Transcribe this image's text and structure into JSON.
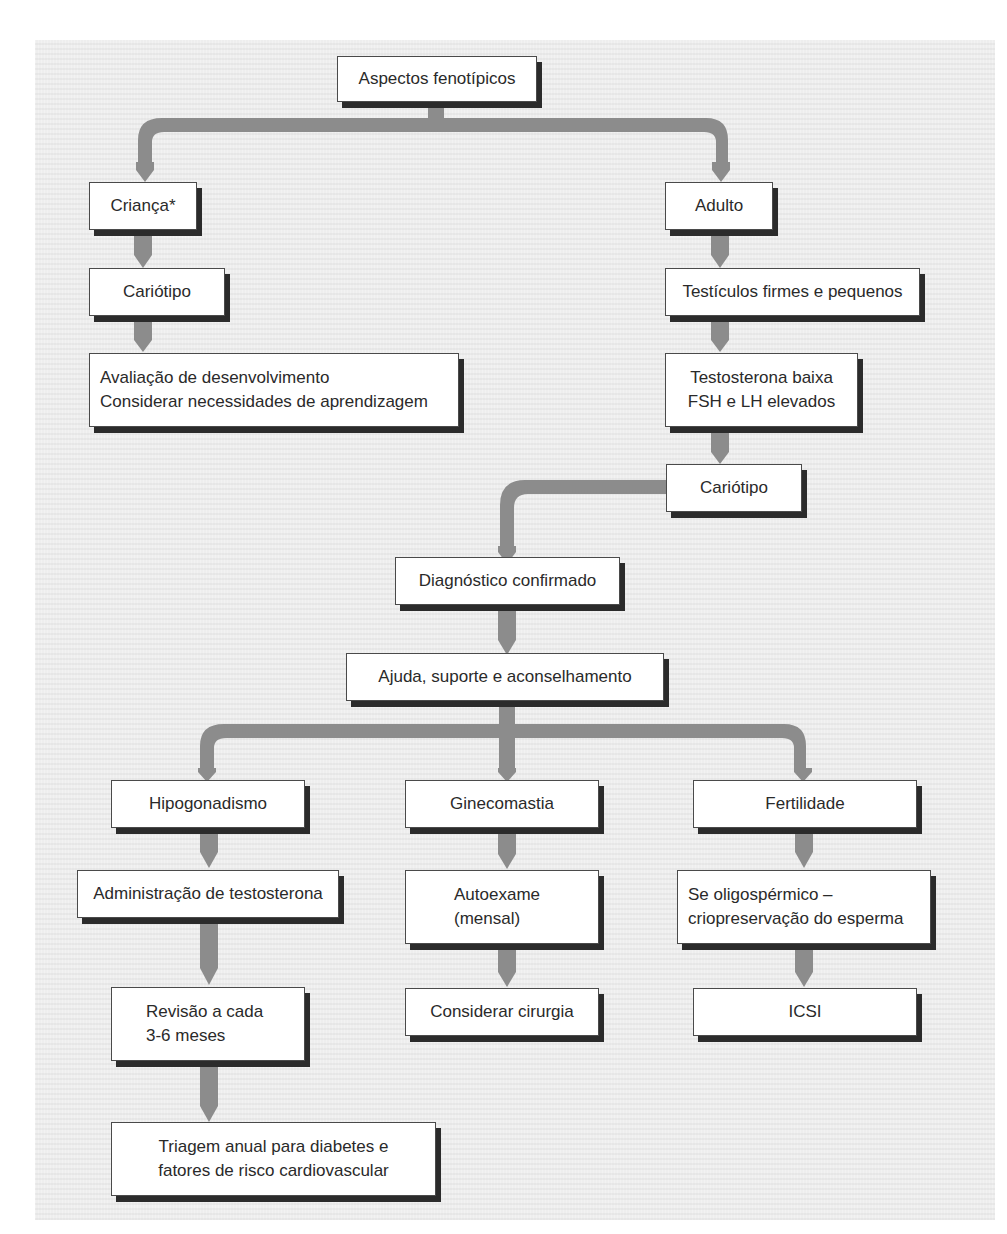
{
  "diagram": {
    "type": "flowchart",
    "colors": {
      "connector": "#8c8c8c",
      "box_border": "#4a4a4a",
      "box_shadow": "#2b2b2b",
      "background": "#eeeeee"
    },
    "nodes": {
      "root": {
        "lines": [
          "Aspectos fenotípicos"
        ]
      },
      "child": {
        "lines": [
          "Criança*"
        ]
      },
      "child_karyotype": {
        "lines": [
          "Cariótipo"
        ]
      },
      "child_eval": {
        "lines": [
          "Avaliação de desenvolvimento",
          "Considerar necessidades de aprendizagem"
        ]
      },
      "adult": {
        "lines": [
          "Adulto"
        ]
      },
      "adult_testes": {
        "lines": [
          "Testículos firmes e pequenos"
        ]
      },
      "adult_hormones": {
        "lines": [
          "Testosterona baixa",
          "FSH e LH elevados"
        ]
      },
      "adult_karyotype": {
        "lines": [
          "Cariótipo"
        ]
      },
      "diagnosis": {
        "lines": [
          "Diagnóstico confirmado"
        ]
      },
      "support": {
        "lines": [
          "Ajuda, suporte e aconselhamento"
        ]
      },
      "hypogonadism": {
        "lines": [
          "Hipogonadismo"
        ]
      },
      "testosterone": {
        "lines": [
          "Administração de testosterona"
        ]
      },
      "review": {
        "lines": [
          "Revisão a cada",
          "3-6 meses"
        ]
      },
      "screening": {
        "lines": [
          "Triagem anual para diabetes e",
          "fatores de risco cardiovascular"
        ]
      },
      "gynecomastia": {
        "lines": [
          "Ginecomastia"
        ]
      },
      "self_exam": {
        "lines": [
          "Autoexame",
          "(mensal)"
        ]
      },
      "surgery": {
        "lines": [
          "Considerar cirurgia"
        ]
      },
      "fertility": {
        "lines": [
          "Fertilidade"
        ]
      },
      "oligospermic": {
        "lines": [
          "Se oligospérmico –",
          "criopreservação do esperma"
        ]
      },
      "icsi": {
        "lines": [
          "ICSI"
        ]
      }
    },
    "edges": [
      [
        "root",
        "child"
      ],
      [
        "root",
        "adult"
      ],
      [
        "child",
        "child_karyotype"
      ],
      [
        "child_karyotype",
        "child_eval"
      ],
      [
        "adult",
        "adult_testes"
      ],
      [
        "adult_testes",
        "adult_hormones"
      ],
      [
        "adult_hormones",
        "adult_karyotype"
      ],
      [
        "adult_karyotype",
        "diagnosis"
      ],
      [
        "diagnosis",
        "support"
      ],
      [
        "support",
        "hypogonadism"
      ],
      [
        "support",
        "gynecomastia"
      ],
      [
        "support",
        "fertility"
      ],
      [
        "hypogonadism",
        "testosterone"
      ],
      [
        "testosterone",
        "review"
      ],
      [
        "review",
        "screening"
      ],
      [
        "gynecomastia",
        "self_exam"
      ],
      [
        "self_exam",
        "surgery"
      ],
      [
        "fertility",
        "oligospermic"
      ],
      [
        "oligospermic",
        "icsi"
      ]
    ]
  }
}
